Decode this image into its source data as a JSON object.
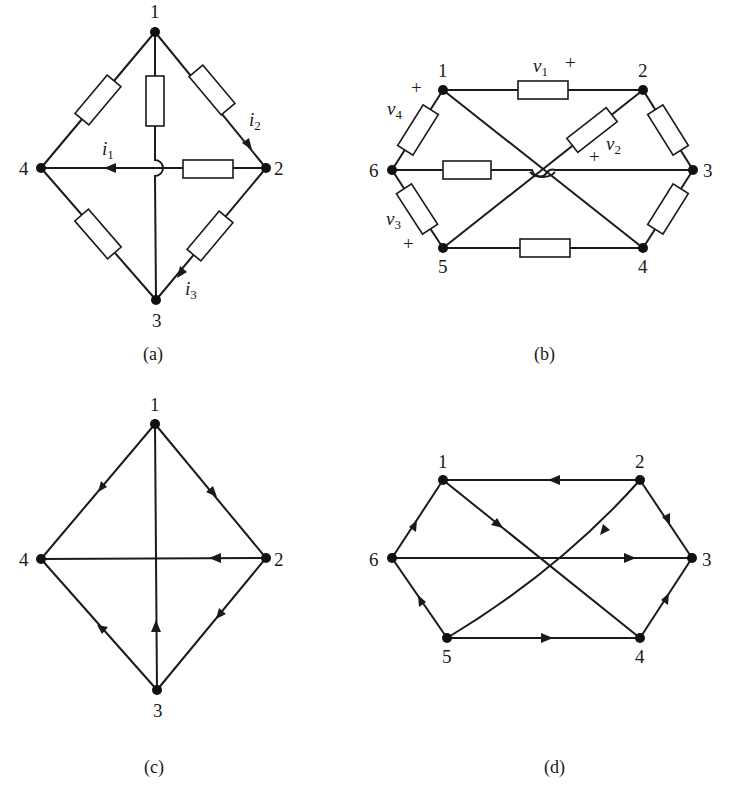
{
  "figure": {
    "panels": [
      {
        "id": "a",
        "caption": "(a)",
        "type": "circuit",
        "nodes": [
          {
            "id": "1",
            "label": "1"
          },
          {
            "id": "2",
            "label": "2"
          },
          {
            "id": "3",
            "label": "3"
          },
          {
            "id": "4",
            "label": "4"
          }
        ],
        "currents": [
          {
            "label": "i",
            "sub": "1",
            "branch": "2-4",
            "direction": "toward 4"
          },
          {
            "label": "i",
            "sub": "2",
            "branch": "1-2",
            "direction": "toward 2"
          },
          {
            "label": "i",
            "sub": "3",
            "branch": "2-3",
            "direction": "toward 3"
          }
        ],
        "branches": [
          "1-4",
          "1-3",
          "1-2",
          "2-4",
          "2-3",
          "4-3"
        ]
      },
      {
        "id": "b",
        "caption": "(b)",
        "type": "circuit",
        "nodes": [
          {
            "id": "1",
            "label": "1"
          },
          {
            "id": "2",
            "label": "2"
          },
          {
            "id": "3",
            "label": "3"
          },
          {
            "id": "4",
            "label": "4"
          },
          {
            "id": "5",
            "label": "5"
          },
          {
            "id": "6",
            "label": "6"
          }
        ],
        "voltages": [
          {
            "label": "v",
            "sub": "1",
            "plus": "+"
          },
          {
            "label": "v",
            "sub": "2",
            "plus": "+"
          },
          {
            "label": "v",
            "sub": "3",
            "plus": "+"
          },
          {
            "label": "v",
            "sub": "4",
            "plus": "+"
          }
        ],
        "branches": [
          "1-2",
          "2-3",
          "3-4",
          "4-5",
          "5-6",
          "6-1",
          "1-4",
          "2-5",
          "6-3"
        ]
      },
      {
        "id": "c",
        "caption": "(c)",
        "type": "directed-graph",
        "nodes": [
          {
            "id": "1",
            "label": "1"
          },
          {
            "id": "2",
            "label": "2"
          },
          {
            "id": "3",
            "label": "3"
          },
          {
            "id": "4",
            "label": "4"
          }
        ],
        "edges": [
          {
            "from": "1",
            "to": "4"
          },
          {
            "from": "1",
            "to": "2"
          },
          {
            "from": "2",
            "to": "4"
          },
          {
            "from": "2",
            "to": "3"
          },
          {
            "from": "3",
            "to": "4"
          },
          {
            "from": "3",
            "to": "1"
          }
        ]
      },
      {
        "id": "d",
        "caption": "(d)",
        "type": "directed-graph",
        "nodes": [
          {
            "id": "1",
            "label": "1"
          },
          {
            "id": "2",
            "label": "2"
          },
          {
            "id": "3",
            "label": "3"
          },
          {
            "id": "4",
            "label": "4"
          },
          {
            "id": "5",
            "label": "5"
          },
          {
            "id": "6",
            "label": "6"
          }
        ],
        "edges": [
          {
            "from": "2",
            "to": "1"
          },
          {
            "from": "2",
            "to": "3"
          },
          {
            "from": "4",
            "to": "3"
          },
          {
            "from": "5",
            "to": "4"
          },
          {
            "from": "5",
            "to": "6"
          },
          {
            "from": "6",
            "to": "1"
          },
          {
            "from": "1",
            "to": "4"
          },
          {
            "from": "2",
            "to": "5"
          },
          {
            "from": "6",
            "to": "3"
          }
        ]
      }
    ]
  }
}
